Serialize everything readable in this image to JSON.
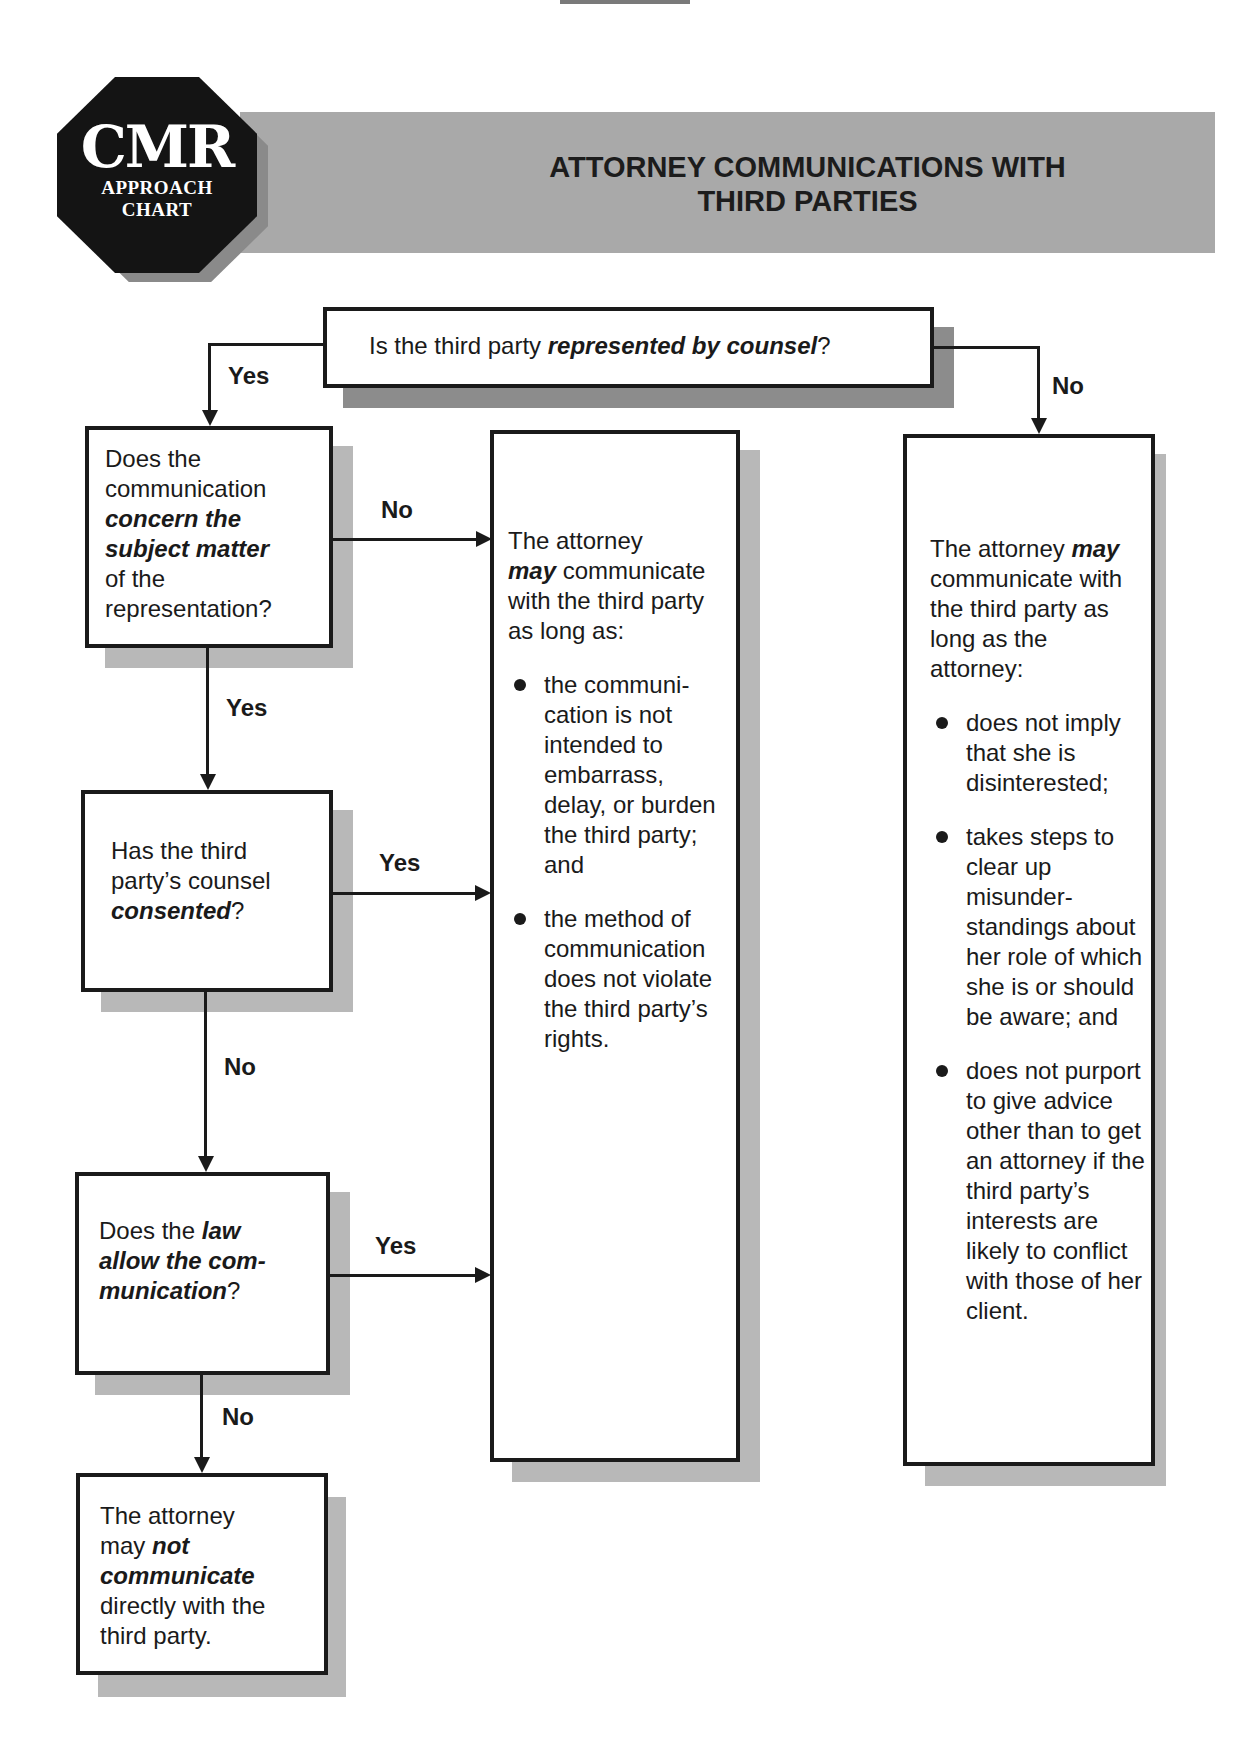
{
  "header": {
    "logo": {
      "main": "CMR",
      "line1": "APPROACH",
      "line2": "CHART"
    },
    "title_line1": "ATTORNEY COMMUNICATIONS WITH",
    "title_line2": "THIRD PARTIES"
  },
  "flow": {
    "q_represented": {
      "pre": "Is the third party ",
      "em": "represented by counsel",
      "post": "?"
    },
    "q_subject": {
      "l1": "Does the",
      "l2": "communication",
      "em1": "concern the",
      "em2": "subject matter",
      "l5": "of the",
      "l6": "representation?"
    },
    "q_consented": {
      "l1": "Has the third",
      "l2": "party’s counsel",
      "em": "consented",
      "post": "?"
    },
    "q_law": {
      "pre": "Does the ",
      "em1": "law",
      "em2": "allow the com-",
      "em3": "munication",
      "post": "?"
    },
    "outcome_not": {
      "l1": "The attorney",
      "pre2": "may ",
      "em2": "not",
      "em3": "communicate",
      "l4": "directly with the",
      "l5": "third party."
    },
    "outcome_represented": {
      "l1": "The attorney",
      "em": "may",
      "l2rest": " communicate",
      "l3": "with the third party",
      "l4": "as long as:",
      "bullets": [
        "the communi-cation is not intended to embarrass, delay, or burden the third party; and",
        "the method of communication does not violate the third party’s rights."
      ]
    },
    "outcome_unrepresented": {
      "pre": "The attorney ",
      "em": "may",
      "rest": "communicate with the third party as long as the attorney:",
      "bullets": [
        "does not imply that she is disinterested;",
        "takes steps to clear up misunder-standings about her role of which she is or should be aware; and",
        "does not purport to give advice other than to get an attorney if the third party’s interests are likely to conflict with those of her client."
      ]
    },
    "labels": {
      "represented_yes": "Yes",
      "represented_no": "No",
      "subject_no": "No",
      "subject_yes": "Yes",
      "consented_yes": "Yes",
      "consented_no": "No",
      "law_yes": "Yes",
      "law_no": "No"
    }
  }
}
